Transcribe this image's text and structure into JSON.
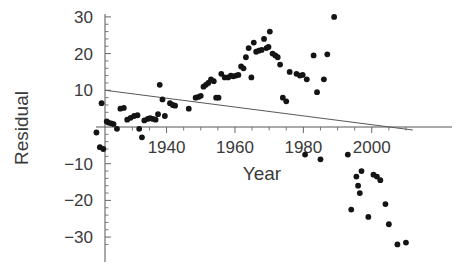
{
  "chart_data": {
    "type": "scatter",
    "title": "",
    "xlabel": "Year",
    "ylabel": "Residual",
    "xlim": [
      1919,
      2012
    ],
    "ylim": [
      -34,
      32
    ],
    "grid": false,
    "legend": null,
    "xticks": [
      1940,
      1960,
      1980,
      2000
    ],
    "xtick_labels": [
      "1940",
      "1960",
      "1980",
      "2000"
    ],
    "yticks": [
      30,
      20,
      10,
      -10,
      -20,
      -30
    ],
    "ytick_labels": [
      "30",
      "20",
      "10",
      "-10",
      "-20",
      "-30"
    ],
    "minor_tick_spacing_x": 5,
    "minor_tick_spacing_y": 2,
    "axis_origin": {
      "x": 1922,
      "y": 0
    },
    "series": [
      {
        "name": "Residual",
        "marker": "filled-circle",
        "color": "#141414",
        "points": [
          [
            1919.5,
            -1.5
          ],
          [
            1920.5,
            -5.5
          ],
          [
            1921.5,
            -6.0
          ],
          [
            1921.0,
            6.5
          ],
          [
            1922.5,
            1.5
          ],
          [
            1923.0,
            1.2
          ],
          [
            1923.8,
            1.0
          ],
          [
            1924.5,
            0.8
          ],
          [
            1925.5,
            -0.5
          ],
          [
            1926.5,
            5.0
          ],
          [
            1927.5,
            5.2
          ],
          [
            1928.5,
            2.0
          ],
          [
            1929.5,
            2.5
          ],
          [
            1930.5,
            3.0
          ],
          [
            1931.5,
            3.2
          ],
          [
            1932.0,
            -0.5
          ],
          [
            1932.8,
            -2.8
          ],
          [
            1933.5,
            1.8
          ],
          [
            1934.5,
            2.2
          ],
          [
            1935.2,
            2.4
          ],
          [
            1936.0,
            2.2
          ],
          [
            1936.8,
            2.0
          ],
          [
            1937.5,
            3.5
          ],
          [
            1938.0,
            11.5
          ],
          [
            1938.8,
            7.5
          ],
          [
            1939.5,
            3.0
          ],
          [
            1941.0,
            6.5
          ],
          [
            1941.8,
            6.0
          ],
          [
            1942.5,
            5.8
          ],
          [
            1946.5,
            5.0
          ],
          [
            1948.5,
            8.0
          ],
          [
            1949.3,
            8.2
          ],
          [
            1950.0,
            8.5
          ],
          [
            1950.8,
            11.0
          ],
          [
            1951.5,
            11.5
          ],
          [
            1952.2,
            12.0
          ],
          [
            1953.0,
            13.0
          ],
          [
            1953.8,
            12.5
          ],
          [
            1954.5,
            8.0
          ],
          [
            1955.2,
            8.0
          ],
          [
            1956.0,
            14.5
          ],
          [
            1957.0,
            13.5
          ],
          [
            1958.0,
            13.5
          ],
          [
            1958.8,
            14.0
          ],
          [
            1959.5,
            13.8
          ],
          [
            1960.3,
            14.0
          ],
          [
            1961.0,
            14.2
          ],
          [
            1961.8,
            16.5
          ],
          [
            1962.5,
            16.0
          ],
          [
            1963.2,
            19.0
          ],
          [
            1964.0,
            21.5
          ],
          [
            1964.8,
            13.5
          ],
          [
            1965.5,
            23.0
          ],
          [
            1966.2,
            20.5
          ],
          [
            1967.0,
            20.8
          ],
          [
            1967.8,
            21.0
          ],
          [
            1968.5,
            24.0
          ],
          [
            1969.2,
            21.5
          ],
          [
            1969.8,
            21.8
          ],
          [
            1970.2,
            26.0
          ],
          [
            1971.0,
            20.0
          ],
          [
            1971.8,
            19.5
          ],
          [
            1972.5,
            19.0
          ],
          [
            1973.2,
            17.0
          ],
          [
            1974.0,
            8.0
          ],
          [
            1975.0,
            7.0
          ],
          [
            1976.0,
            15.0
          ],
          [
            1978.0,
            14.5
          ],
          [
            1979.0,
            14.0
          ],
          [
            1979.8,
            14.2
          ],
          [
            1981.0,
            13.0
          ],
          [
            1983.0,
            19.5
          ],
          [
            1984.0,
            9.5
          ],
          [
            1986.0,
            13.0
          ],
          [
            1987.0,
            19.8
          ],
          [
            1989.0,
            30.0
          ],
          [
            1980.5,
            -7.5
          ],
          [
            1985.0,
            -8.8
          ],
          [
            1993.0,
            -7.5
          ],
          [
            1997.0,
            -12.0
          ],
          [
            1995.5,
            -13.5
          ],
          [
            2000.5,
            -13.0
          ],
          [
            2001.5,
            -13.5
          ],
          [
            2002.5,
            -14.5
          ],
          [
            1996.0,
            -16.0
          ],
          [
            1996.5,
            -18.0
          ],
          [
            1994.0,
            -22.5
          ],
          [
            2004.0,
            -21.0
          ],
          [
            1999.0,
            -24.5
          ],
          [
            2005.0,
            -26.5
          ],
          [
            2007.5,
            -32.0
          ],
          [
            2010.0,
            -31.5
          ]
        ]
      }
    ],
    "trend_line": {
      "name": "fitted-trend",
      "color": "#5a5a5a",
      "start": [
        1922,
        10.0
      ],
      "end": [
        2012,
        -0.8
      ]
    }
  },
  "labels": {
    "y_axis_title": "Residual",
    "x_axis_title": "Year"
  }
}
